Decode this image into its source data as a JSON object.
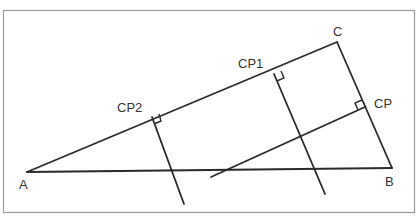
{
  "diagram": {
    "type": "geometry",
    "labels": {
      "A": "A",
      "B": "B",
      "C": "C",
      "CP1": "CP1",
      "CP2": "CP2",
      "CP": "CP"
    },
    "points": {
      "A": [
        27,
        172
      ],
      "B": [
        392,
        168
      ],
      "C": [
        337,
        42
      ],
      "CP1_foot": [
        274,
        74
      ],
      "CP2_foot": [
        152,
        117
      ],
      "CP_foot": [
        365,
        107
      ]
    },
    "segments": [
      {
        "name": "side-AC",
        "from": "A",
        "to": "C"
      },
      {
        "name": "side-AB",
        "from": "A",
        "to": "B"
      },
      {
        "name": "side-CB",
        "from": "C",
        "to": "B"
      },
      {
        "name": "perpendicular-CP1",
        "from": [
          274,
          74
        ],
        "to": [
          325,
          194
        ]
      },
      {
        "name": "perpendicular-CP2",
        "from": [
          152,
          117
        ],
        "to": [
          184,
          204
        ]
      },
      {
        "name": "perpendicular-CP",
        "from": [
          365,
          107
        ],
        "to": [
          211,
          177
        ]
      }
    ],
    "colors": {
      "line": "#2a2a2a",
      "frame": "#9a9a9a",
      "text": "#333333",
      "background": "#ffffff"
    }
  }
}
